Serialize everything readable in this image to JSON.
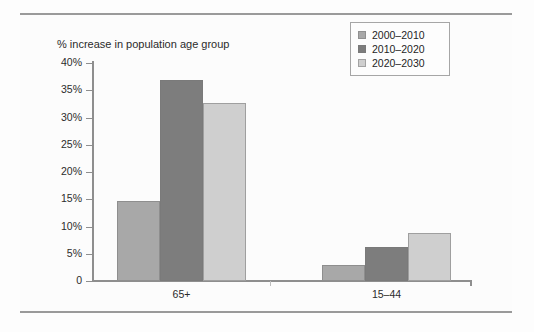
{
  "chart_data": {
    "type": "bar",
    "title": "% increase in population age group",
    "xlabel": "",
    "ylabel": "",
    "ylim": [
      0,
      40
    ],
    "grid": false,
    "legend_position": "top-right",
    "categories": [
      "65+",
      "15–44"
    ],
    "ytick_labels": [
      "40%",
      "35%",
      "30%",
      "25%",
      "20%",
      "15%",
      "10%",
      "5%",
      "0"
    ],
    "ytick_values": [
      40,
      35,
      30,
      25,
      20,
      15,
      10,
      5,
      0
    ],
    "series": [
      {
        "name": "2000–2010",
        "color": "#a8a8a8",
        "values": [
          14.7,
          2.9
        ]
      },
      {
        "name": "2010–2020",
        "color": "#7d7d7d",
        "values": [
          36.8,
          6.3
        ]
      },
      {
        "name": "2020–2030",
        "color": "#cfcfcf",
        "values": [
          32.6,
          8.8
        ]
      }
    ]
  },
  "legend": {
    "items": [
      {
        "label": "2000–2010"
      },
      {
        "label": "2010–2020"
      },
      {
        "label": "2020–2030"
      }
    ]
  },
  "axis": {
    "y_labels": [
      "40%",
      "35%",
      "30%",
      "25%",
      "20%",
      "15%",
      "10%",
      "5%",
      "0"
    ],
    "x_labels": [
      "65+",
      "15–44"
    ]
  },
  "colors": {
    "series_1": "#a8a8a8",
    "series_2": "#7d7d7d",
    "series_3": "#cfcfcf",
    "axis": "#8e8e8e",
    "text": "#2b2b2b",
    "rule": "#9a9a9a",
    "background": "#fdfdfd"
  }
}
